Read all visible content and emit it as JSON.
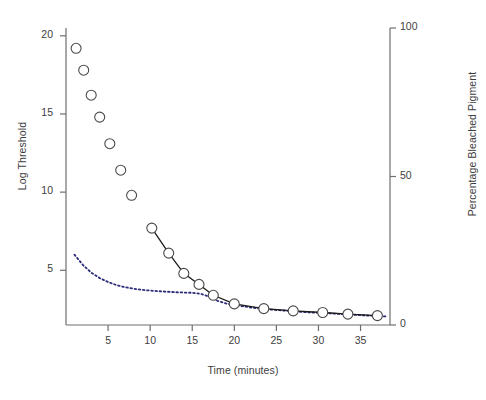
{
  "chart_data": {
    "type": "scatter",
    "title": "",
    "xlabel": "Time (minutes)",
    "ylabel": "Log Threshold",
    "ylabel_right": "Percentage Bleached Pigment",
    "xlim": [
      0,
      38.5
    ],
    "ylim": [
      1.5,
      20.5
    ],
    "ylim_right": [
      0,
      100
    ],
    "xticks": [
      5,
      10,
      15,
      20,
      25,
      30,
      35
    ],
    "yticks": [
      5,
      10,
      15,
      20
    ],
    "yticks_right": [
      0,
      50,
      100
    ],
    "grid": false,
    "legend": "none",
    "series": [
      {
        "name": "Log Threshold (measured)",
        "marker": "open-circle",
        "marker_color": "#ffffff",
        "marker_edge": "#4a4a4a",
        "x": [
          1.2,
          2.1,
          3.0,
          4.0,
          5.2,
          6.5,
          7.8,
          10.2,
          12.2,
          14.0,
          15.8,
          17.5,
          20.0,
          23.5,
          27.0,
          30.5,
          33.5,
          37.0
        ],
        "y": [
          19.2,
          17.8,
          16.2,
          14.8,
          13.1,
          11.4,
          9.8,
          7.7,
          6.1,
          4.8,
          4.1,
          3.4,
          2.85,
          2.55,
          2.4,
          2.3,
          2.2,
          2.1
        ]
      },
      {
        "name": "Dark adaptation fit",
        "line": "solid",
        "color": "#1a1a1a",
        "x": [
          10.2,
          12.2,
          14.0,
          15.8,
          17.5,
          20.0,
          23.5,
          27.0,
          30.5,
          33.5,
          37.0
        ],
        "y": [
          7.7,
          6.1,
          4.8,
          4.1,
          3.4,
          2.85,
          2.55,
          2.4,
          2.3,
          2.2,
          2.1
        ]
      },
      {
        "name": "Percentage bleached pigment",
        "line": "dotted",
        "color": "#2b2b7a",
        "x": [
          1.0,
          2.0,
          3.0,
          4.0,
          5.0,
          6.0,
          7.0,
          8.0,
          9.0,
          10.0,
          11.0,
          12.0,
          13.0,
          14.0,
          15.0,
          16.0,
          17.0,
          18.0,
          19.0,
          20.0,
          22.0,
          24.0,
          26.0,
          28.0,
          30.0,
          32.0,
          34.0,
          36.0,
          38.0
        ],
        "y": [
          6.0,
          5.35,
          4.85,
          4.5,
          4.25,
          4.05,
          3.92,
          3.82,
          3.75,
          3.7,
          3.66,
          3.63,
          3.6,
          3.58,
          3.56,
          3.5,
          3.32,
          3.05,
          2.88,
          2.78,
          2.62,
          2.5,
          2.42,
          2.34,
          2.28,
          2.22,
          2.16,
          2.1,
          2.05
        ]
      }
    ],
    "xtick_labels": [
      "5",
      "10",
      "15",
      "20",
      "25",
      "30",
      "35"
    ],
    "ytick_labels": [
      "5",
      "10",
      "15",
      "20"
    ],
    "ytick_right_labels": [
      "0",
      "50",
      "100"
    ]
  },
  "axes": {
    "left_title": "Log Threshold",
    "right_title": "Percentage Bleached Pigment",
    "bottom_title": "Time (minutes)"
  },
  "colors": {
    "axis": "#6e6e6e",
    "text": "#3d3d3d",
    "solid_line": "#1a1a1a",
    "dotted_line": "#2b2b7a",
    "marker_edge": "#4a4a4a",
    "background": "#ffffff"
  }
}
